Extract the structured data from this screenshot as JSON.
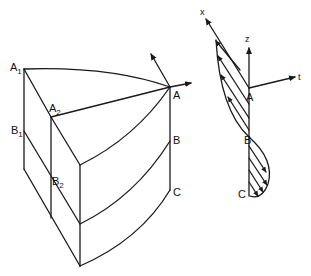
{
  "figure": {
    "block": {
      "labels": {
        "A1": {
          "main": "A",
          "sub": "1"
        },
        "A2": {
          "main": "A",
          "sub": "2"
        },
        "B1": {
          "main": "B",
          "sub": "1"
        },
        "B2": {
          "main": "B",
          "sub": "2"
        },
        "A": "A",
        "B": "B",
        "C": "C"
      }
    },
    "profile": {
      "axes": {
        "x": "x",
        "z": "z",
        "t": "t"
      },
      "labels": {
        "A": "A",
        "B": "B",
        "C": "C"
      }
    }
  }
}
